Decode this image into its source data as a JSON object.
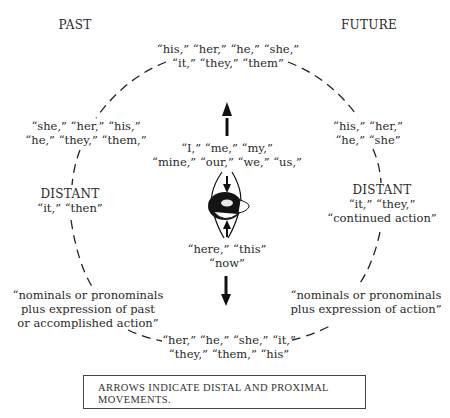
{
  "headings": {
    "past": "PAST",
    "future": "FUTURE"
  },
  "top": {
    "line1": "“his,” “her,” “he,” “she,”",
    "line2": "“it,” “they,” “them”"
  },
  "upper_left": {
    "line1": "“she,” “her,” “his,”",
    "line2": "“he,” “they,” “them,”"
  },
  "upper_right": {
    "line1": "“his,” “her,”",
    "line2": "“he,” “she”"
  },
  "center_top": {
    "line1": "“I,” “me,” “my,”",
    "line2": "“mine,” “our,” “we,” “us,”"
  },
  "center_bottom": {
    "line1": "“here,” “this”",
    "line2": "“now”"
  },
  "left_distant": {
    "title": "DISTANT",
    "line1": "“it,” “then”"
  },
  "right_distant": {
    "title": "DISTANT",
    "line1": "“it,” “they,”",
    "line2": "“continued action”"
  },
  "lower_left": {
    "line1": "“nominals or pronominals",
    "line2": "plus expression of past",
    "line3": "or accomplished action”"
  },
  "lower_right": {
    "line1": "“nominals or pronominals",
    "line2": "plus expression of action”"
  },
  "bottom": {
    "line1": "“her,” “he,” “she,” “it,”",
    "line2": "“they,” “them,” “his”"
  },
  "legend": {
    "line1": "ARROWS INDICATE DISTAL AND PROXIMAL",
    "line2": "MOVEMENTS."
  },
  "icons": {
    "center_figure": "person-head-top-view-icon",
    "arrows": [
      "arrow-up-icon",
      "arrow-down-icon"
    ]
  }
}
